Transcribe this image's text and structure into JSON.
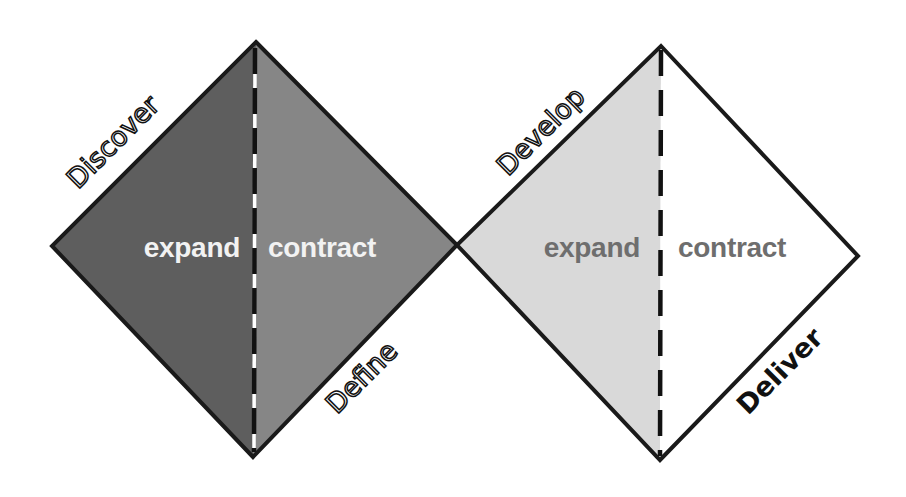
{
  "diagram": {
    "colors": {
      "discover_fill": "#5e5e5e",
      "define_fill": "#868686",
      "develop_fill": "#d9d9d9",
      "deliver_fill": "#ffffff",
      "outline": "#1a1a1a",
      "label_light": "#f2f2f2",
      "label_dark": "#6e6e6e"
    },
    "diamonds": [
      {
        "name": "problem-diamond",
        "left_half": {
          "phase": "Discover",
          "mode": "expand"
        },
        "right_half": {
          "phase": "Define",
          "mode": "contract"
        }
      },
      {
        "name": "solution-diamond",
        "left_half": {
          "phase": "Develop",
          "mode": "expand"
        },
        "right_half": {
          "phase": "Deliver",
          "mode": "contract"
        }
      }
    ]
  }
}
